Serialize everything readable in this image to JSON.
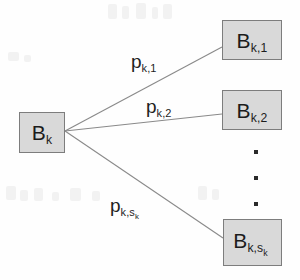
{
  "diagram": {
    "type": "branching-transition-diagram",
    "source_node": {
      "id": "source",
      "base": "B",
      "subscript": "k",
      "label_plain": "B_k"
    },
    "target_nodes": [
      {
        "id": "target-1",
        "base": "B",
        "subscript": "k,1",
        "label_plain": "B_k,1"
      },
      {
        "id": "target-2",
        "base": "B",
        "subscript": "k,2",
        "label_plain": "B_k,2"
      },
      {
        "id": "target-last",
        "base": "B",
        "subscript": "k,s",
        "sub_subscript": "k",
        "label_plain": "B_k,s_k"
      }
    ],
    "edges": [
      {
        "id": "edge-1",
        "from": "source",
        "to": "target-1",
        "base": "p",
        "subscript": "k,1",
        "label_plain": "p_k,1"
      },
      {
        "id": "edge-2",
        "from": "source",
        "to": "target-2",
        "base": "p",
        "subscript": "k,2",
        "label_plain": "p_k,2"
      },
      {
        "id": "edge-last",
        "from": "source",
        "to": "target-last",
        "base": "p",
        "subscript": "k,s",
        "sub_subscript": "k",
        "label_plain": "p_k,s_k"
      }
    ],
    "ellipsis": {
      "id": "vertical-ellipsis",
      "orientation": "vertical",
      "dot_count": 3,
      "meaning": "continues"
    },
    "colors": {
      "node_fill": "#d9d9d9",
      "node_border": "#7d7d7d",
      "text": "#1c1c1c",
      "edge_line": "#8a8a8a",
      "background": "#fefefe"
    }
  }
}
